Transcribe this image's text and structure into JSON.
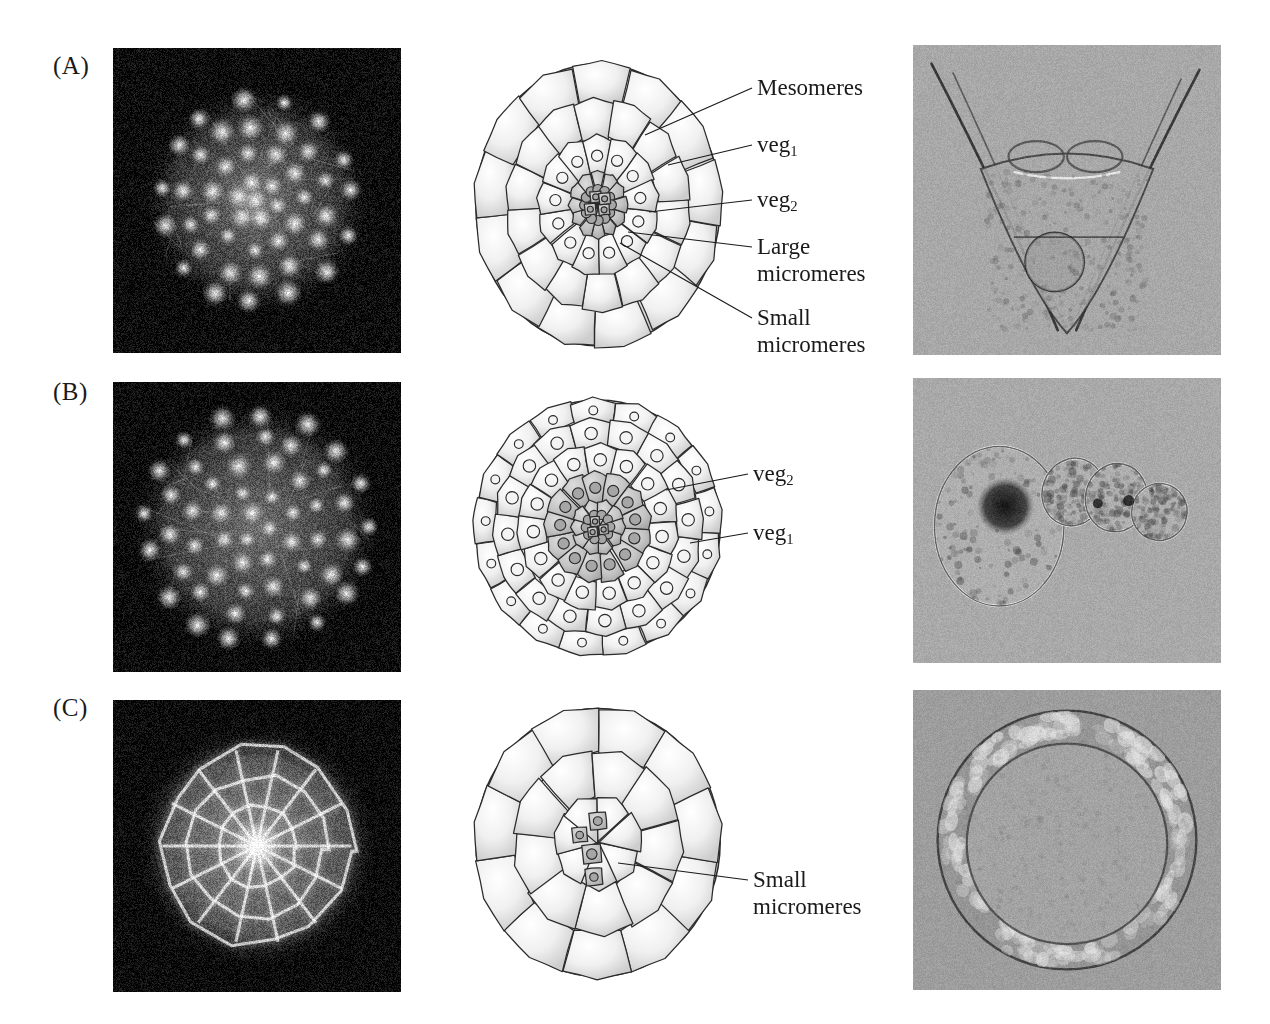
{
  "figure": {
    "type": "scientific-figure-sea-urchin-cleavage",
    "rows": 3,
    "columns": 3
  },
  "rows": [
    {
      "letter": "(A)",
      "fluorescence": {
        "name": "fluorescence-micrograph-a",
        "style": "dark-field-nuclei",
        "background": "#0b0b0b"
      },
      "diagram": {
        "name": "blastula-diagram-a",
        "cells": "60-cell vegetal view",
        "shaded_cells": "large micromeres"
      },
      "dic": {
        "name": "dic-micrograph-a",
        "subject": "pluteus larva",
        "background": "#a8a8a8"
      },
      "labels": [
        {
          "text": "Mesomeres",
          "sub": ""
        },
        {
          "text": "veg",
          "sub": "1"
        },
        {
          "text": "veg",
          "sub": "2"
        },
        {
          "text": "Large",
          "line2": "micromeres",
          "sub": ""
        },
        {
          "text": "Small",
          "line2": "micromeres",
          "sub": ""
        }
      ]
    },
    {
      "letter": "(B)",
      "fluorescence": {
        "name": "fluorescence-micrograph-b",
        "style": "dark-field-nuclei",
        "background": "#0b0b0b"
      },
      "diagram": {
        "name": "blastula-diagram-b",
        "cells": "dense blastula vegetal view",
        "shaded_cells": "veg2 derivatives"
      },
      "dic": {
        "name": "dic-micrograph-b",
        "subject": "dissociated cell cluster",
        "background": "#a8a8a8"
      },
      "labels": [
        {
          "text": "veg",
          "sub": "2"
        },
        {
          "text": "veg",
          "sub": "1"
        }
      ]
    },
    {
      "letter": "(C)",
      "fluorescence": {
        "name": "fluorescence-micrograph-c",
        "style": "bright-cell-outlines",
        "background": "#0b0b0b"
      },
      "diagram": {
        "name": "blastula-diagram-c",
        "cells": "large-cell blastula vegetal view",
        "shaded_cells": "small micromeres"
      },
      "dic": {
        "name": "dic-micrograph-c",
        "subject": "hollow blastula",
        "background": "#9d9d9d"
      },
      "labels": [
        {
          "text": "Small",
          "line2": "micromeres",
          "sub": ""
        }
      ]
    }
  ],
  "label_text": {
    "mesomeres": "Mesomeres",
    "veg": "veg",
    "sub1": "1",
    "sub2": "2",
    "large": "Large",
    "small": "Small",
    "micromeres": "micromeres"
  },
  "colors": {
    "ink": "#1a1a1a",
    "cell_outline": "#2b2b2b",
    "cell_fill_light": "#f2f2f2",
    "cell_fill_shaded": "#b9b9b9",
    "nucleus_shaded": "#a6a6a6",
    "dark_background": "#0b0b0b",
    "dic_background": "#a8a8a8"
  }
}
